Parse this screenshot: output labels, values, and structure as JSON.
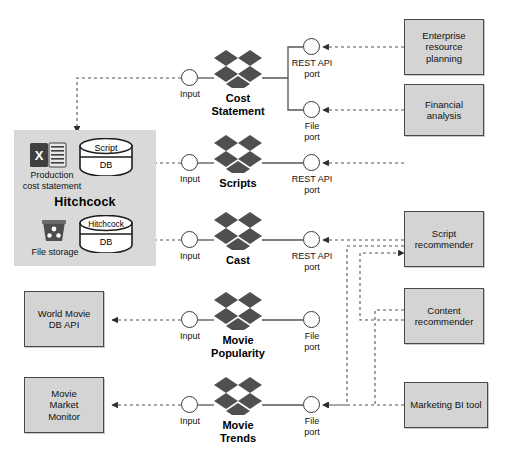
{
  "diagram": {
    "caption": "",
    "colors": {
      "system_fill": "#d4d4d4",
      "system_border": "#4a4a4a",
      "platform_fill": "#d9d9d9",
      "logo_dark": "#4f4f4f",
      "wire": "#555555",
      "port_border": "#3a3a3a"
    }
  },
  "platform": {
    "name": "Hitchcock",
    "artifacts": [
      {
        "icon": "excel-file-icon",
        "label": "Production\ncost statement"
      },
      {
        "icon": "file-storage-icon",
        "label": "File storage"
      }
    ],
    "databases": [
      {
        "icon": "database-cylinder-icon",
        "top": "Script",
        "bottom": "DB"
      },
      {
        "icon": "database-cylinder-icon",
        "top": "Hitchcock",
        "bottom": "DB"
      }
    ]
  },
  "datasets": [
    {
      "id": "cost-statement",
      "label": "Cost\nStatement",
      "icon": "dropbox-logo-icon",
      "input": {
        "label": "Input"
      },
      "outputs": [
        {
          "label": "REST API\nport"
        },
        {
          "label": "File\nport"
        }
      ]
    },
    {
      "id": "scripts",
      "label": "Scripts",
      "icon": "dropbox-logo-icon",
      "input": {
        "label": "Input"
      },
      "outputs": [
        {
          "label": "REST API\nport"
        }
      ]
    },
    {
      "id": "cast",
      "label": "Cast",
      "icon": "dropbox-logo-icon",
      "input": {
        "label": "Input"
      },
      "outputs": [
        {
          "label": "REST API\nport"
        }
      ]
    },
    {
      "id": "movie-popularity",
      "label": "Movie\nPopularity",
      "icon": "dropbox-logo-icon",
      "input": {
        "label": "Input"
      },
      "outputs": [
        {
          "label": "File\nport"
        }
      ]
    },
    {
      "id": "movie-trends",
      "label": "Movie\nTrends",
      "icon": "dropbox-logo-icon",
      "input": {
        "label": "Input"
      },
      "outputs": [
        {
          "label": "File\nport"
        }
      ]
    }
  ],
  "consumers": [
    {
      "id": "enterprise-resource-planning",
      "label": "Enterprise\nresource\nplanning"
    },
    {
      "id": "financial-analysis",
      "label": "Financial\nanalysis"
    },
    {
      "id": "script-recommender",
      "label": "Script\nrecommender"
    },
    {
      "id": "content-recommender",
      "label": "Content\nrecommender"
    },
    {
      "id": "marketing-bi-tool",
      "label": "Marketing BI tool"
    }
  ],
  "sources": [
    {
      "id": "world-movie-db-api",
      "label": "World Movie\nDB API"
    },
    {
      "id": "movie-market-monitor",
      "label": "Movie\nMarket\nMonitor"
    }
  ]
}
